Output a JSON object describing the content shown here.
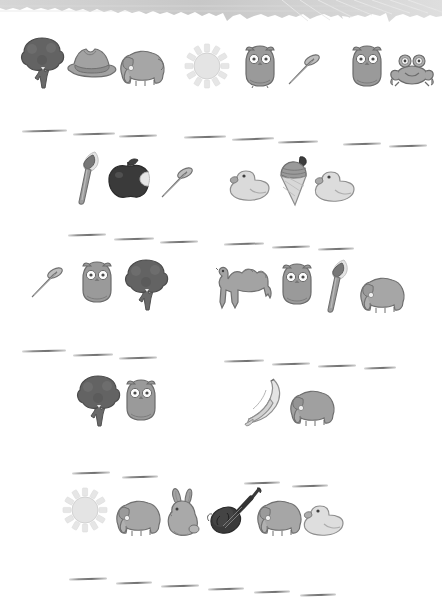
{
  "worksheet": {
    "title": "Picture Word Worksheet",
    "page_background": "#ffffff",
    "header": {
      "name": "torn-paper-header",
      "style": "torn grey paper strip with faint diagonal leaf-vein lines",
      "color": "#cfcfcf",
      "height_px": 28
    },
    "palette": {
      "dark": "#5e5e5e",
      "mid_dark": "#8a8a8a",
      "mid": "#a9a9a9",
      "light": "#c9c9c9",
      "very_light": "#e2e2e2",
      "outline": "#6b6b6b",
      "line": "#7d7d7d",
      "black_object": "#3a3a3a"
    },
    "rows": [
      {
        "index": 1,
        "groups": [
          {
            "name": "group-1a",
            "items": [
              "tree",
              "hat",
              "elephant"
            ],
            "answer_blanks": 3
          },
          {
            "name": "group-1b",
            "items": [
              "sun",
              "owl",
              "nail"
            ],
            "answer_blanks": 3
          },
          {
            "name": "group-1c",
            "items": [
              "owl",
              "frog"
            ],
            "answer_blanks": 2
          }
        ]
      },
      {
        "index": 2,
        "groups": [
          {
            "name": "group-2a",
            "items": [
              "paintbrush",
              "apple",
              "nail"
            ],
            "answer_blanks": 3
          },
          {
            "name": "group-2b",
            "items": [
              "duck",
              "ice-cream",
              "duck"
            ],
            "answer_blanks": 3
          }
        ]
      },
      {
        "index": 3,
        "groups": [
          {
            "name": "group-3a",
            "items": [
              "nail",
              "owl",
              "tree"
            ],
            "answer_blanks": 3
          },
          {
            "name": "group-3b",
            "items": [
              "camel",
              "owl",
              "paintbrush",
              "elephant"
            ],
            "answer_blanks": 4
          }
        ]
      },
      {
        "index": 4,
        "groups": [
          {
            "name": "group-4a",
            "items": [
              "tree",
              "owl"
            ],
            "answer_blanks": 3
          },
          {
            "name": "group-4b",
            "items": [
              "banana",
              "elephant"
            ],
            "answer_blanks": 4
          }
        ]
      },
      {
        "index": 5,
        "groups": [
          {
            "name": "group-5a",
            "items": [
              "sun",
              "elephant",
              "rabbit",
              "violin",
              "elephant",
              "duck"
            ],
            "answer_blanks": 4
          }
        ]
      },
      {
        "index": 6,
        "groups": [
          {
            "name": "group-6a",
            "items": [],
            "answer_blanks": 6
          }
        ]
      }
    ],
    "icon_names": [
      "tree-icon",
      "hat-icon",
      "elephant-icon",
      "sun-icon",
      "owl-icon",
      "nail-icon",
      "frog-icon",
      "paintbrush-icon",
      "apple-icon",
      "duck-icon",
      "ice-cream-icon",
      "camel-icon",
      "banana-icon",
      "rabbit-icon",
      "violin-icon"
    ]
  }
}
